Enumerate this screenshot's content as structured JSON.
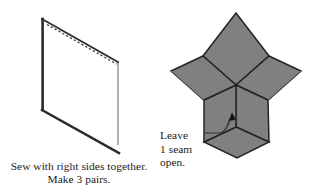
{
  "figure": {
    "background_color": "#ffffff",
    "ink_color": "#1c1c1c"
  },
  "left_diagram": {
    "name": "fabric-piece-parallelogram",
    "description": "Parallelogram fabric patch shown in perspective with dashed stitching line along the top edge",
    "outline_color": "#2b2b2b",
    "fill_color": "#ffffff",
    "stitch_line_style": "dashed",
    "stitch_line_color": "#3a3a3a"
  },
  "right_diagram": {
    "name": "six-pointed-star",
    "description": "Six-pointed star pieced from six gray diamonds radiating from a center point",
    "diamond_fill": "#808080",
    "seam_line_color": "#242424",
    "diamond_count": 6
  },
  "caption": {
    "lines": [
      "Sew with right sides together.",
      "Make 3 pairs."
    ],
    "line1": "Sew with right sides together.",
    "line2": "Make 3 pairs."
  },
  "annotation": {
    "lines": [
      "Leave",
      "1 seam",
      "open."
    ],
    "line1": "Leave",
    "line2": "1 seam",
    "line3": "open.",
    "leader_line": "callout-leader-with-arrowhead",
    "arrow_target": "center seam of star"
  }
}
